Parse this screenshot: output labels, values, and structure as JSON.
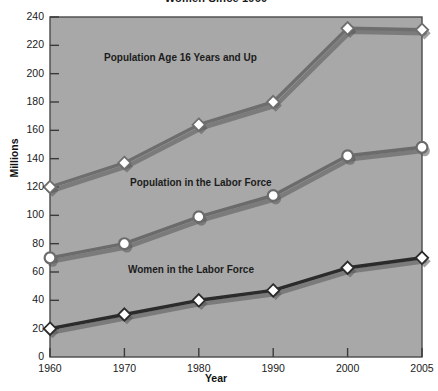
{
  "chart_data": {
    "type": "line",
    "title": "Women Since 1960",
    "xlabel": "Year",
    "ylabel": "Millions",
    "categories": [
      "1960",
      "1970",
      "1980",
      "1990",
      "2000",
      "2005"
    ],
    "x": [
      1960,
      1970,
      1980,
      1990,
      2000,
      2005
    ],
    "ylim": [
      0,
      240
    ],
    "ytick_step": 20,
    "yticks": [
      0,
      20,
      40,
      60,
      80,
      100,
      120,
      140,
      160,
      180,
      200,
      220,
      240
    ],
    "grid": false,
    "legend_position": "inline-annotations",
    "plot_background": "#a8a8a8",
    "series": [
      {
        "name": "Population Age 16 Years and Up",
        "marker": "diamond",
        "values": [
          120,
          137,
          164,
          180,
          232,
          231
        ],
        "color": "#6e6e6e",
        "marker_fill": "#ffffff",
        "label_x": 104,
        "label_y": 52
      },
      {
        "name": "Population in the Labor Force",
        "marker": "circle",
        "values": [
          70,
          80,
          99,
          114,
          142,
          148
        ],
        "color": "#6b6b6b",
        "marker_fill": "#ffffff",
        "label_x": 130,
        "label_y": 177
      },
      {
        "name": "Women in the Labor Force",
        "marker": "diamond",
        "values": [
          20,
          30,
          40,
          47,
          63,
          70
        ],
        "color": "#2b2b2b",
        "marker_fill": "#ffffff",
        "label_x": 128,
        "label_y": 264
      }
    ],
    "annotations": [
      {
        "text": "Population Age 16 Years and Up"
      },
      {
        "text": "Population in the Labor Force"
      },
      {
        "text": "Women in the Labor Force"
      }
    ]
  }
}
